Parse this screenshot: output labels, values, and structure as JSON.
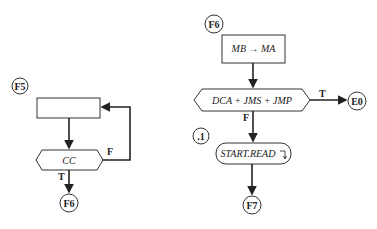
{
  "left_flow": {
    "entry_connector": "F5",
    "process_box": "",
    "decision": "CC",
    "false_label": "F",
    "true_label": "T",
    "exit_connector": "F6"
  },
  "right_flow": {
    "entry_connector": "F6",
    "process_box": "MB → MA",
    "decision": "DCA + JMS + JMP",
    "true_label": "T",
    "true_connector": "E0",
    "false_label": "F",
    "subroutine_label": ".1",
    "subroutine_call": "START.READ",
    "return_glyph": "⌝",
    "exit_connector": "F7"
  }
}
